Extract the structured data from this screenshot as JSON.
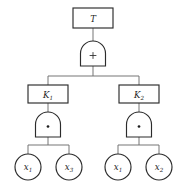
{
  "diagram": {
    "type": "fault-tree",
    "colors": {
      "stroke": "#2b2b2b",
      "connector": "#6e6e6e",
      "fill": "#ffffff",
      "text": "#1c1c1c"
    },
    "top_event": {
      "id": "T",
      "label": "T",
      "shape": "rectangle"
    },
    "gates": [
      {
        "id": "gate-top",
        "symbol": "+",
        "operation": "OR",
        "shape": "and-gate-dome",
        "parent": "T",
        "children": [
          "K1",
          "K2"
        ]
      },
      {
        "id": "gate-k1",
        "symbol": "·",
        "operation": "AND",
        "shape": "and-gate-dome",
        "parent": "K1",
        "children": [
          "x1-left",
          "x3-left"
        ]
      },
      {
        "id": "gate-k2",
        "symbol": "·",
        "operation": "AND",
        "shape": "and-gate-dome",
        "parent": "K2",
        "children": [
          "x1-right",
          "x2-right"
        ]
      }
    ],
    "intermediate_events": [
      {
        "id": "K1",
        "base": "K",
        "sub": "1",
        "shape": "rectangle"
      },
      {
        "id": "K2",
        "base": "K",
        "sub": "2",
        "shape": "rectangle"
      }
    ],
    "basic_events": [
      {
        "id": "x1-left",
        "base": "x",
        "sub": "1",
        "shape": "circle"
      },
      {
        "id": "x3-left",
        "base": "x",
        "sub": "3",
        "shape": "circle"
      },
      {
        "id": "x1-right",
        "base": "x",
        "sub": "1",
        "shape": "circle"
      },
      {
        "id": "x2-right",
        "base": "x",
        "sub": "2",
        "shape": "circle"
      }
    ]
  }
}
